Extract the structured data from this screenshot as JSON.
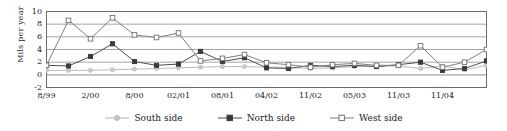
{
  "chart_data": {
    "type": "line",
    "title": "",
    "xlabel": "",
    "ylabel": "Mils per year",
    "ylim": [
      -2,
      10
    ],
    "yticks": [
      -2,
      0,
      2,
      4,
      6,
      8,
      10
    ],
    "grid": true,
    "legend_position": "bottom",
    "x_tick_count": 21,
    "x_labeled_ticks": [
      "8/99",
      "2/00",
      "8/00",
      "02/01",
      "08/01",
      "04/02",
      "11/02",
      "05/03",
      "11/03",
      "11/04"
    ],
    "x_labeled_indices": [
      0,
      2,
      4,
      6,
      8,
      10,
      12,
      14,
      16,
      18
    ],
    "x": [
      0,
      1,
      2,
      3,
      4,
      5,
      6,
      7,
      8,
      9,
      10,
      11,
      12,
      13,
      14,
      15,
      16,
      17,
      18,
      19,
      20
    ],
    "series": [
      {
        "name": "South side",
        "color": "#b3b3b3",
        "marker": "circle",
        "values": [
          0.7,
          0.7,
          0.7,
          0.8,
          0.9,
          1.0,
          1.1,
          1.2,
          1.3,
          1.3,
          1.2,
          1.2,
          1.0,
          1.1,
          1.3,
          1.4,
          1.4,
          1.0,
          1.4,
          0.8,
          1.5
        ]
      },
      {
        "name": "North side",
        "color": "#4d4d4d",
        "marker": "square-filled",
        "values": [
          1.5,
          1.4,
          2.9,
          4.9,
          2.1,
          1.5,
          1.7,
          3.7,
          2.1,
          2.7,
          1.1,
          1.0,
          1.5,
          1.3,
          1.5,
          1.3,
          1.6,
          2.0,
          0.7,
          1.0,
          2.2
        ]
      },
      {
        "name": "West side",
        "color": "#808080",
        "marker": "square-open",
        "values": [
          1.5,
          8.6,
          5.7,
          9.0,
          6.3,
          5.9,
          6.6,
          2.2,
          2.6,
          3.2,
          1.9,
          1.6,
          1.2,
          1.6,
          1.8,
          1.5,
          1.5,
          4.6,
          1.2,
          2.0,
          4.0
        ]
      }
    ]
  },
  "legend": {
    "items": [
      {
        "label": "South side"
      },
      {
        "label": "North side"
      },
      {
        "label": "West side"
      }
    ]
  }
}
